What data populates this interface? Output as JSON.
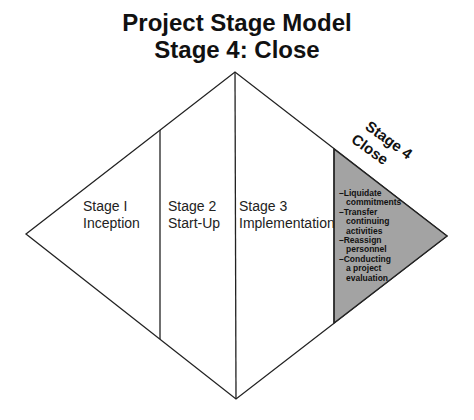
{
  "title": {
    "line1": "Project Stage Model",
    "line2": "Stage 4: Close"
  },
  "diagram": {
    "colors": {
      "outline": "#222222",
      "fill": "#ffffff",
      "highlight": "#a3a3a3"
    },
    "stages": [
      {
        "name": "Stage I",
        "label": "Inception"
      },
      {
        "name": "Stage 2",
        "label": "Start-Up"
      },
      {
        "name": "Stage 3",
        "label": "Implementation"
      },
      {
        "name": "Stage 4",
        "label": "Close"
      }
    ],
    "active_stage": {
      "name": "Stage 4",
      "label": "Close",
      "tasks": [
        "–Liquidate\ncommitments",
        "–Transfer\ncontinuing\nactivities",
        "–Reassign\npersonnel",
        "–Conducting\na project\nevaluation"
      ]
    }
  }
}
